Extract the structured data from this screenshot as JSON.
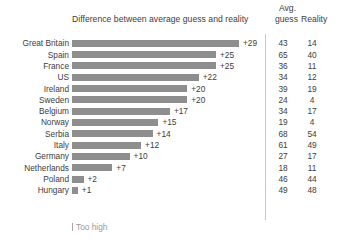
{
  "header": {
    "bar_column_title": "Difference between average guess and reality",
    "avg_line1": "Avg.",
    "avg_line2": "guess",
    "reality": "Reality"
  },
  "legend": {
    "too_high": "Too high"
  },
  "colors": {
    "bar": "#8e8e8e",
    "text": "#3d3d3d",
    "divider": "#c9c9c9",
    "legend_text": "#9a9a9a"
  },
  "chart_data": {
    "type": "bar",
    "title": "Difference between average guess and reality",
    "xlabel": "",
    "ylabel": "",
    "orientation": "horizontal",
    "grid": false,
    "legend": [
      "Too high"
    ],
    "xlim": [
      0,
      29
    ],
    "categories": [
      "Great Britain",
      "Spain",
      "France",
      "US",
      "Ireland",
      "Sweden",
      "Belgium",
      "Norway",
      "Serbia",
      "Italy",
      "Germany",
      "Netherlands",
      "Poland",
      "Hungary"
    ],
    "series": [
      {
        "name": "Difference (avg guess - reality)",
        "values": [
          29,
          25,
          25,
          22,
          20,
          20,
          17,
          15,
          14,
          12,
          10,
          7,
          2,
          1
        ]
      },
      {
        "name": "Avg. guess",
        "values": [
          43,
          65,
          36,
          34,
          39,
          24,
          34,
          19,
          68,
          61,
          27,
          18,
          46,
          49
        ]
      },
      {
        "name": "Reality",
        "values": [
          14,
          40,
          11,
          12,
          19,
          4,
          17,
          4,
          54,
          49,
          17,
          11,
          44,
          48
        ]
      }
    ],
    "rows": [
      {
        "category": "Great Britain",
        "difference": 29,
        "difference_label": "+29",
        "avg_guess": 43,
        "reality": 14
      },
      {
        "category": "Spain",
        "difference": 25,
        "difference_label": "+25",
        "avg_guess": 65,
        "reality": 40
      },
      {
        "category": "France",
        "difference": 25,
        "difference_label": "+25",
        "avg_guess": 36,
        "reality": 11
      },
      {
        "category": "US",
        "difference": 22,
        "difference_label": "+22",
        "avg_guess": 34,
        "reality": 12
      },
      {
        "category": "Ireland",
        "difference": 20,
        "difference_label": "+20",
        "avg_guess": 39,
        "reality": 19
      },
      {
        "category": "Sweden",
        "difference": 20,
        "difference_label": "+20",
        "avg_guess": 24,
        "reality": 4
      },
      {
        "category": "Belgium",
        "difference": 17,
        "difference_label": "+17",
        "avg_guess": 34,
        "reality": 17
      },
      {
        "category": "Norway",
        "difference": 15,
        "difference_label": "+15",
        "avg_guess": 19,
        "reality": 4
      },
      {
        "category": "Serbia",
        "difference": 14,
        "difference_label": "+14",
        "avg_guess": 68,
        "reality": 54
      },
      {
        "category": "Italy",
        "difference": 12,
        "difference_label": "+12",
        "avg_guess": 61,
        "reality": 49
      },
      {
        "category": "Germany",
        "difference": 10,
        "difference_label": "+10",
        "avg_guess": 27,
        "reality": 17
      },
      {
        "category": "Netherlands",
        "difference": 7,
        "difference_label": "+7",
        "avg_guess": 18,
        "reality": 11
      },
      {
        "category": "Poland",
        "difference": 2,
        "difference_label": "+2",
        "avg_guess": 46,
        "reality": 44
      },
      {
        "category": "Hungary",
        "difference": 1,
        "difference_label": "+1",
        "avg_guess": 49,
        "reality": 48
      }
    ]
  }
}
